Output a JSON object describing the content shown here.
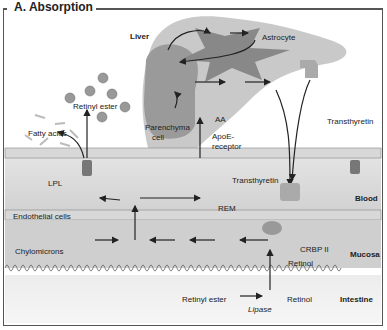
{
  "figure": {
    "title": "A. Absorption",
    "regions": {
      "liver": "Liver",
      "astrocyte": "Astrocyte",
      "blood": "Blood",
      "mucosa": "Mucosa",
      "intestine": "Intestine",
      "endothelial": "Endothelial cells"
    },
    "labels": {
      "retinyl_ester_top": "Retinyl ester",
      "fatty_acids": "Fatty acids",
      "parenchyma": "Parenchyma",
      "parenchyma2": "cell",
      "apoe": "ApoE-",
      "apoe2": "receptor",
      "aa": "AA",
      "transthyretin_top": "Transthyretin",
      "transthyretin_blood": "Transthyretin",
      "lpl": "LPL",
      "rem": "REM",
      "chylomicrons": "Chylomicrons",
      "crbp2": "CRBP II",
      "retinol_mucosa": "Retinol",
      "retinyl_ester_bottom": "Retinyl ester",
      "lipase": "Lipase",
      "retinol_bottom": "Retinol"
    },
    "molecules": {
      "re": "RE",
      "r": "R",
      "crbp": "CRBP",
      "rbp": "RBP",
      "cm": "CM"
    }
  }
}
